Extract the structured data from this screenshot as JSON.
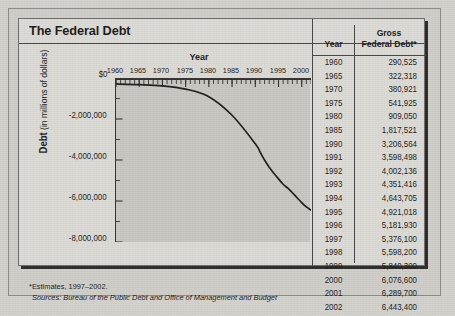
{
  "figure": {
    "title": "The Federal Debt",
    "notes": {
      "estimates": "*Estimates, 1997–2002.",
      "sources": "Sources: Bureau of the Public Debt and Office of Management and Budget"
    }
  },
  "table": {
    "headers": {
      "year": "Year",
      "debt_line1": "Gross",
      "debt_line2": "Federal Debt*"
    },
    "rows": [
      {
        "year": "1960",
        "debt": "290,525"
      },
      {
        "year": "1965",
        "debt": "322,318"
      },
      {
        "year": "1970",
        "debt": "380,921"
      },
      {
        "year": "1975",
        "debt": "541,925"
      },
      {
        "year": "1980",
        "debt": "909,050"
      },
      {
        "year": "1985",
        "debt": "1,817,521"
      },
      {
        "year": "1990",
        "debt": "3,206,564"
      },
      {
        "year": "1991",
        "debt": "3,598,498"
      },
      {
        "year": "1992",
        "debt": "4,002,136"
      },
      {
        "year": "1993",
        "debt": "4,351,416"
      },
      {
        "year": "1994",
        "debt": "4,643,705"
      },
      {
        "year": "1995",
        "debt": "4,921,018"
      },
      {
        "year": "1996",
        "debt": "5,181,930"
      },
      {
        "year": "1997",
        "debt": "5,376,100"
      },
      {
        "year": "1998",
        "debt": "5,598,200"
      },
      {
        "year": "1999",
        "debt": "5,840,300"
      },
      {
        "year": "2000",
        "debt": "6,076,600"
      },
      {
        "year": "2001",
        "debt": "6,289,700"
      },
      {
        "year": "2002",
        "debt": "6,443,400"
      }
    ]
  },
  "chart_data": {
    "type": "line",
    "title": "The Federal Debt",
    "xlabel": "Year",
    "ylabel": "Debt (in millions of dollars)",
    "xlim": [
      1960,
      2002
    ],
    "ylim": [
      -8000000,
      0
    ],
    "xticks": [
      1960,
      1965,
      1970,
      1975,
      1980,
      1985,
      1990,
      1995,
      2000
    ],
    "xtick_labels": [
      "1960",
      "1965",
      "1970",
      "1975",
      "1980",
      "1985",
      "1990",
      "1995",
      "2000"
    ],
    "yticks": [
      0,
      -2000000,
      -4000000,
      -6000000,
      -8000000
    ],
    "ytick_labels": [
      "$0",
      "-2,000,000",
      "-4,000,000",
      "-6,000,000",
      "-8,000,000"
    ],
    "minor_xtick_interval": 1,
    "grid": false,
    "legend": false,
    "series": [
      {
        "name": "Gross Federal Debt (plotted as negative)",
        "color": "#1f1d1b",
        "x": [
          1960,
          1965,
          1970,
          1975,
          1980,
          1985,
          1990,
          1991,
          1992,
          1993,
          1994,
          1995,
          1996,
          1997,
          1998,
          1999,
          2000,
          2001,
          2002
        ],
        "y": [
          -290525,
          -322318,
          -380921,
          -541925,
          -909050,
          -1817521,
          -3206564,
          -3598498,
          -4002136,
          -4351416,
          -4643705,
          -4921018,
          -5181930,
          -5376100,
          -5598200,
          -5840300,
          -6076600,
          -6289700,
          -6443400
        ]
      }
    ]
  }
}
